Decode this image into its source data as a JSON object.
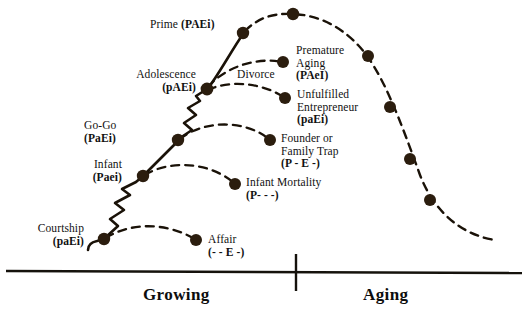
{
  "diagram": {
    "title_visible": false,
    "colors": {
      "stroke": "#1a1208",
      "node": "#2b1d0e",
      "axis": "#15120c",
      "text": "#111111"
    },
    "axis": {
      "baseline_label_left": "Growing",
      "baseline_label_right": "Aging"
    },
    "stages": [
      {
        "id": "courtship",
        "name": "Courtship",
        "code": "(paEi)",
        "label_x": 8,
        "label_y": 222,
        "align": "left",
        "node": {
          "x": 104,
          "y": 239
        }
      },
      {
        "id": "infant",
        "name": "Infant",
        "code": "(Paei)",
        "label_x": 55,
        "label_y": 158,
        "align": "left",
        "node": {
          "x": 143,
          "y": 176
        }
      },
      {
        "id": "go-go",
        "name": "Go-Go",
        "code": "(PaEi)",
        "label_x": 84,
        "label_y": 119,
        "align": "left",
        "node": {
          "x": 178,
          "y": 140
        }
      },
      {
        "id": "adolescence",
        "name": "Adolescence",
        "code": "(pAEi)",
        "label_x": 110,
        "label_y": 68,
        "align": "left",
        "node": {
          "x": 207,
          "y": 89
        }
      },
      {
        "id": "prime",
        "name": "Prime",
        "code": "(PAEi)",
        "label_x": 150,
        "label_y": 18,
        "align": "left",
        "node": {
          "x": 243,
          "y": 33
        }
      }
    ],
    "pathologies": [
      {
        "id": "affair",
        "name": "Affair",
        "code": "(- - E -)",
        "label_x": 208,
        "label_y": 233,
        "node": {
          "x": 196,
          "y": 240
        }
      },
      {
        "id": "infant-mortality",
        "name": "Infant Mortality",
        "code": "(P- - -)",
        "label_x": 247,
        "label_y": 176,
        "node": {
          "x": 235,
          "y": 184
        }
      },
      {
        "id": "founder-or-family-trap",
        "name": "Founder or\nFamily Trap",
        "name_line1": "Founder or",
        "name_line2": "Family Trap",
        "code": "(P - E -)",
        "label_x": 281,
        "label_y": 132,
        "node": {
          "x": 270,
          "y": 140
        }
      },
      {
        "id": "unfulfilled-entrepreneur",
        "name_line1": "Unfulfilled",
        "name_line2": "Entrepreneur",
        "code": "(paEi)",
        "label_x": 297,
        "label_y": 88,
        "node": {
          "x": 285,
          "y": 98
        }
      },
      {
        "id": "premature-aging",
        "name_line1": "Premature",
        "name_line2": "Aging",
        "code": "(PAeI)",
        "label_x": 296,
        "label_y": 44,
        "node": {
          "x": 283,
          "y": 62
        }
      },
      {
        "id": "divorce",
        "name": "Divorce",
        "code": "",
        "label_x": 237,
        "label_y": 68,
        "node": null
      }
    ],
    "aging_nodes": [
      {
        "id": "peak",
        "x": 293,
        "y": 14
      },
      {
        "id": "stable",
        "x": 368,
        "y": 56
      },
      {
        "id": "aristocracy",
        "x": 390,
        "y": 107
      },
      {
        "id": "recrimination",
        "x": 410,
        "y": 159
      },
      {
        "id": "bureaucracy",
        "x": 430,
        "y": 200
      }
    ]
  }
}
